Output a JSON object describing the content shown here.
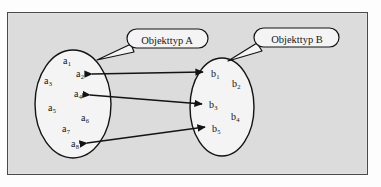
{
  "figure": {
    "frame_border_color": "#4a4a4a",
    "frame_fill_color": "#dcdcdc",
    "page_color": "#fdfdfd",
    "ink_color": "#111315"
  },
  "callouts": [
    {
      "id": "a",
      "label": "Objekttyp A",
      "points_to": "ellipse-a"
    },
    {
      "id": "b",
      "label": "Objekttyp B",
      "points_to": "ellipse-b"
    }
  ],
  "ellipses": [
    {
      "id": "ellipse-a",
      "name": "Objekttyp A",
      "cx": 73,
      "cy": 104,
      "rx": 38,
      "ry": 54,
      "members": [
        {
          "id": "a1",
          "base": "a",
          "sub": "1",
          "x": 63,
          "y": 62
        },
        {
          "id": "a2",
          "base": "a",
          "sub": "2",
          "x": 76,
          "y": 75
        },
        {
          "id": "a3",
          "base": "a",
          "sub": "3",
          "x": 44,
          "y": 82
        },
        {
          "id": "a4",
          "base": "a",
          "sub": "4",
          "x": 74,
          "y": 95
        },
        {
          "id": "a5",
          "base": "a",
          "sub": "5",
          "x": 48,
          "y": 109
        },
        {
          "id": "a6",
          "base": "a",
          "sub": "6",
          "x": 81,
          "y": 119
        },
        {
          "id": "a7",
          "base": "a",
          "sub": "7",
          "x": 62,
          "y": 130
        },
        {
          "id": "a8",
          "base": "a",
          "sub": "8",
          "x": 71,
          "y": 145
        }
      ]
    },
    {
      "id": "ellipse-b",
      "name": "Objekttyp B",
      "cx": 222,
      "cy": 107,
      "rx": 32,
      "ry": 49,
      "members": [
        {
          "id": "b1",
          "base": "b",
          "sub": "1",
          "x": 211,
          "y": 75
        },
        {
          "id": "b2",
          "base": "b",
          "sub": "2",
          "x": 232,
          "y": 85
        },
        {
          "id": "b3",
          "base": "b",
          "sub": "3",
          "x": 209,
          "y": 106
        },
        {
          "id": "b4",
          "base": "b",
          "sub": "4",
          "x": 231,
          "y": 118
        },
        {
          "id": "b5",
          "base": "b",
          "sub": "5",
          "x": 212,
          "y": 130
        }
      ]
    }
  ],
  "connections": [
    {
      "id": "conn-a2-b1",
      "from": "a2",
      "to": "b1",
      "style": "double-arrow"
    },
    {
      "id": "conn-a4-b3",
      "from": "a4",
      "to": "b3",
      "style": "double-arrow"
    },
    {
      "id": "conn-a8-b5",
      "from": "a8",
      "to": "b5",
      "style": "double-arrow"
    }
  ],
  "bleed_through": [
    {
      "text": "——— —— ———— ——",
      "x": 200,
      "y": 82
    },
    {
      "text": "———— ——— ——",
      "x": 206,
      "y": 92
    },
    {
      "text": "—————— ———",
      "x": 214,
      "y": 150
    },
    {
      "text": "——— ————— —— ———",
      "x": 196,
      "y": 163
    }
  ]
}
